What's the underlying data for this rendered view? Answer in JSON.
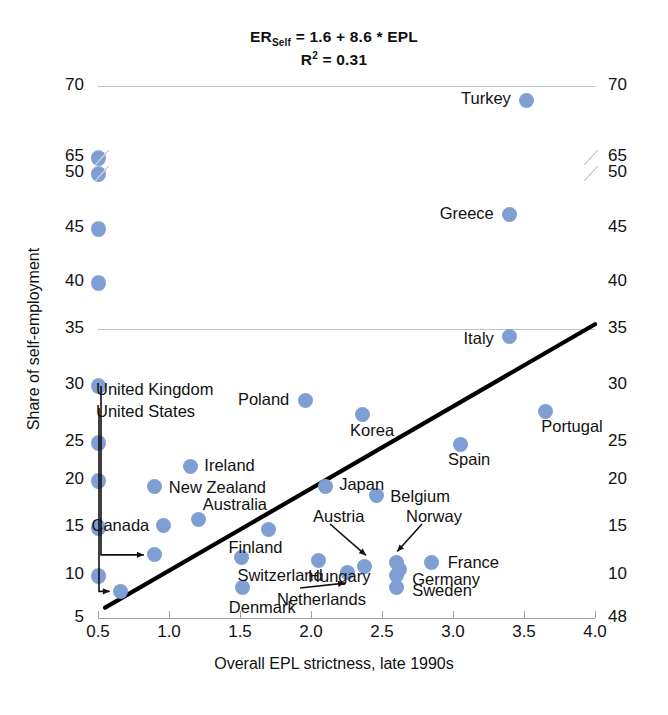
{
  "chart_data": {
    "type": "scatter",
    "title_line1_prefix": "ER",
    "title_line1_sub": "Self",
    "title_line1_rest": " = 1.6 + 8.6 * EPL",
    "title_line2_prefix": "R",
    "title_line2_sup": "2",
    "title_line2_rest": " = 0.31",
    "r_squared": 0.31,
    "intercept": 1.6,
    "slope": 8.6,
    "xlabel": "Overall EPL strictness, late 1990s",
    "ylabel": "Share of self-employment",
    "xlim": [
      0.5,
      4.0
    ],
    "xticks": [
      "0.5",
      "1.0",
      "1.5",
      "2.0",
      "2.5",
      "3.0",
      "3.5",
      "4.0"
    ],
    "yticks_left": [
      "70",
      "65",
      "50",
      "45",
      "40",
      "35",
      "30",
      "25",
      "20",
      "15",
      "10",
      "5"
    ],
    "yticks_right": [
      "70",
      "65",
      "50",
      "45",
      "40",
      "35",
      "30",
      "25",
      "20",
      "15",
      "10",
      "48"
    ],
    "axis_break": true,
    "axis_break_between": [
      50,
      65
    ],
    "grid": true,
    "legend": "none",
    "marker_color": "#7f9fd4",
    "trendline_color": "#000000",
    "trendline": {
      "x0": 0.55,
      "y0": 6.2,
      "x1": 4.0,
      "y1": 35.5
    },
    "points": [
      {
        "label": "Turkey",
        "x": 3.52,
        "y": 69.0,
        "label_pos": "left"
      },
      {
        "label": "Greece",
        "x": 3.4,
        "y": 46.2,
        "label_pos": "left"
      },
      {
        "label": "Italy",
        "x": 3.4,
        "y": 34.3,
        "label_pos": "left"
      },
      {
        "label": "Portugal",
        "x": 3.65,
        "y": 27.7,
        "label_pos": "below"
      },
      {
        "label": "Spain",
        "x": 3.05,
        "y": 24.7,
        "label_pos": "below"
      },
      {
        "label": "Poland",
        "x": 1.96,
        "y": 28.6,
        "label_pos": "left"
      },
      {
        "label": "Korea",
        "x": 2.36,
        "y": 27.4,
        "label_pos": "below-left"
      },
      {
        "label": "Japan",
        "x": 2.1,
        "y": 19.3,
        "label_pos": "right"
      },
      {
        "label": "Belgium",
        "x": 2.46,
        "y": 18.3,
        "label_pos": "right"
      },
      {
        "label": "Ireland",
        "x": 1.15,
        "y": 21.8,
        "label_pos": "right"
      },
      {
        "label": "New Zealand",
        "x": 0.9,
        "y": 19.3,
        "label_pos": "right"
      },
      {
        "label": "Australia",
        "x": 1.21,
        "y": 15.8,
        "label_pos": "above-right"
      },
      {
        "label": "Canada",
        "x": 0.96,
        "y": 15.2,
        "label_pos": "left"
      },
      {
        "label": "Hungary",
        "x": 2.05,
        "y": 11.5,
        "label_pos": "below-left"
      },
      {
        "label": "United Kingdom",
        "x": 0.9,
        "y": 12.1,
        "label_pos": "leader"
      },
      {
        "label": "United States",
        "x": 0.66,
        "y": 8.1,
        "label_pos": "leader"
      },
      {
        "label": "Switzerland",
        "x": 1.51,
        "y": 11.8,
        "label_pos": "below-right"
      },
      {
        "label": "Denmark",
        "x": 1.52,
        "y": 8.5,
        "label_pos": "below-left"
      },
      {
        "label": "Netherlands",
        "x": 2.26,
        "y": 10.3,
        "label_pos": "leader"
      },
      {
        "label": "Austria",
        "x": 2.38,
        "y": 10.9,
        "label_pos": "leader"
      },
      {
        "label": "Norway",
        "x": 2.6,
        "y": 11.3,
        "label_pos": "leader"
      },
      {
        "label": "Germany",
        "x": 2.6,
        "y": 10.0,
        "label_pos": "right"
      },
      {
        "label": "Sweden",
        "x": 2.6,
        "y": 8.5,
        "label_pos": "right"
      },
      {
        "label": "France",
        "x": 2.85,
        "y": 11.3,
        "label_pos": "right"
      },
      {
        "label": "Finland",
        "x": 1.7,
        "y": 14.7,
        "label_pos": "below"
      }
    ],
    "extra_unlabeled_points": [
      {
        "x": 2.62,
        "y": 10.6
      }
    ]
  }
}
